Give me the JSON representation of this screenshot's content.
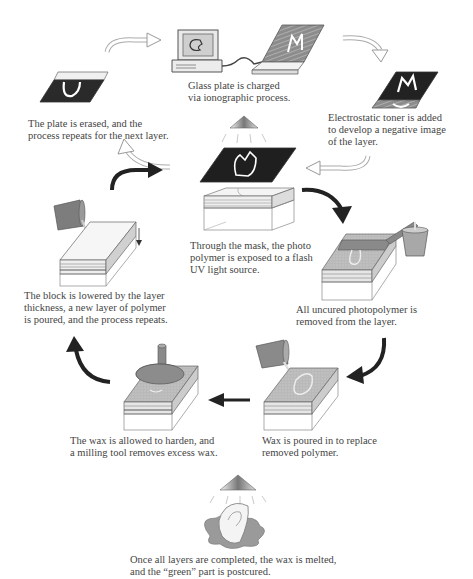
{
  "figure": {
    "title_clipped": "",
    "type": "process-cycle"
  },
  "steps": [
    {
      "id": "charge",
      "caption": "Glass plate is charged\nvia ionographic process."
    },
    {
      "id": "toner",
      "caption": "Electrostatic toner is added\nto develop a negative image\nof the layer."
    },
    {
      "id": "erase",
      "caption": "The plate is erased, and the\nprocess repeats for the next layer."
    },
    {
      "id": "expose",
      "caption": "Through the mask, the photo\npolymer  is exposed  to a flash\nUV light  source."
    },
    {
      "id": "remove",
      "caption": "All uncured photopolymer is\nremoved from the layer."
    },
    {
      "id": "lower",
      "caption": "The block is lowered by  the layer\nthickness,  a new layer of polymer\nis poured, and the process repeats."
    },
    {
      "id": "wax",
      "caption": "Wax is poured in to replace\nremoved polymer."
    },
    {
      "id": "mill",
      "caption": "The wax is allowed to harden, and\na milling tool removes excess wax."
    },
    {
      "id": "postcure",
      "caption": "Once all layers are completed, the wax is melted,\nand the “green” part is postcured."
    }
  ],
  "colors": {
    "dark": "#2a2a2a",
    "mid": "#8a8a8a",
    "light": "#c8c8c8",
    "outline": "#555555"
  }
}
